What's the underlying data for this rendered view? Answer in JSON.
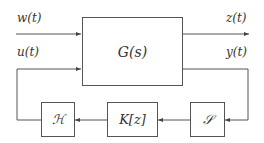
{
  "diagram": {
    "type": "block-diagram",
    "plant": {
      "label": "G(s)"
    },
    "inputs": [
      {
        "label": "w(t)"
      },
      {
        "label": "u(t)"
      }
    ],
    "outputs": [
      {
        "label": "z(t)"
      },
      {
        "label": "y(t)"
      }
    ],
    "feedback_blocks": [
      {
        "id": "hold",
        "label": "ℋ"
      },
      {
        "id": "controller",
        "label": "K[z]"
      },
      {
        "id": "sampler",
        "label": "𝒮"
      }
    ],
    "colors": {
      "line": "#555555",
      "text": "#333333",
      "background": "#ffffff"
    }
  }
}
